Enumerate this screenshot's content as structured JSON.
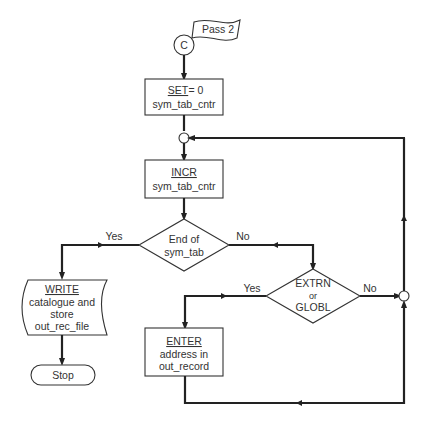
{
  "flowchart": {
    "start": {
      "connector": "C",
      "flag": "Pass 2"
    },
    "set_box": {
      "keyword": "SET",
      "suffix": " = 0",
      "line2": "sym_tab_cntr"
    },
    "incr_box": {
      "keyword": "INCR",
      "line2": "sym_tab_cntr"
    },
    "decision1": {
      "line1": "End of",
      "line2": "sym_tab",
      "yes": "Yes",
      "no": "No"
    },
    "decision2": {
      "line1": "EXTRN",
      "line2": "or",
      "line3": "GLOBL",
      "yes": "Yes",
      "no": "No"
    },
    "write_box": {
      "keyword": "WRITE",
      "line2": "catalogue and",
      "line3": "store",
      "line4": "out_rec_file"
    },
    "enter_box": {
      "keyword": "ENTER",
      "line2": "address in",
      "line3": "out_record"
    },
    "stop": {
      "label": "Stop"
    }
  }
}
